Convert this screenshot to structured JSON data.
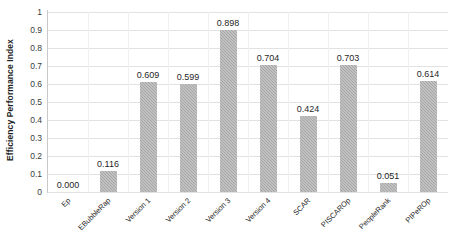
{
  "chart_data": {
    "type": "bar",
    "title": "",
    "subtitle": "",
    "xlabel": "",
    "ylabel": "Efficiency Performance Index",
    "ylim": [
      0,
      1
    ],
    "ytick_labels": [
      "1",
      "0.9",
      "0.8",
      "0.7",
      "0.6",
      "0.5",
      "0.4",
      "0.3",
      "0.2",
      "0.1",
      "0"
    ],
    "ytick_values": [
      1,
      0.9,
      0.8,
      0.7,
      0.6,
      0.5,
      0.4,
      0.3,
      0.2,
      0.1,
      0
    ],
    "grid": true,
    "grid_orientation": "horizontal",
    "legend": false,
    "legend_position": "none",
    "bar_color": "#a6a6a6",
    "bar_pattern": "diagonal-hatch",
    "data_labels": true,
    "categories": [
      "Ep",
      "EBubbleRap",
      "Version 1",
      "Version 2",
      "Version 3",
      "Version 4",
      "SCAR",
      "PISCAROp",
      "PeopleRank",
      "PIPeROp"
    ],
    "values": [
      0.0,
      0.116,
      0.609,
      0.599,
      0.898,
      0.704,
      0.424,
      0.703,
      0.051,
      0.614
    ],
    "value_labels": [
      "0.000",
      "0.116",
      "0.609",
      "0.599",
      "0.898",
      "0.704",
      "0.424",
      "0.703",
      "0.051",
      "0.614"
    ]
  }
}
